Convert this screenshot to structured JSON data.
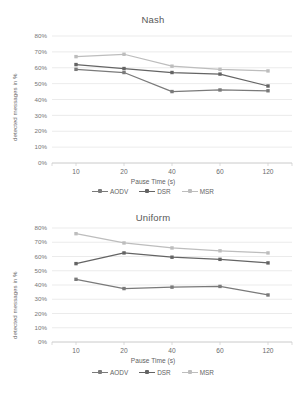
{
  "colors": {
    "aodv": "#7a7a7a",
    "dsr": "#646464",
    "msr": "#bdbdbd",
    "grid": "#e2e2e2",
    "axis": "#cccccc",
    "text": "#5f5f5f",
    "background": "#ffffff"
  },
  "common": {
    "xlabel": "Pause Time (s)",
    "ylabel": "detected messages in %",
    "categories": [
      "10",
      "20",
      "40",
      "60",
      "120"
    ],
    "yticks": [
      "0%",
      "10%",
      "20%",
      "30%",
      "40%",
      "50%",
      "60%",
      "70%",
      "80%"
    ],
    "legend": [
      {
        "label": "AODV",
        "color": "#7a7a7a"
      },
      {
        "label": "DSR",
        "color": "#646464"
      },
      {
        "label": "MSR",
        "color": "#bdbdbd"
      }
    ]
  },
  "chart_data": [
    {
      "type": "line",
      "title": "Nash",
      "xlabel": "Pause Time (s)",
      "ylabel": "detected messages in %",
      "categories": [
        "10",
        "20",
        "40",
        "60",
        "120"
      ],
      "x": [
        10,
        20,
        40,
        60,
        120
      ],
      "ylim": [
        0,
        80
      ],
      "ytick_values": [
        0,
        10,
        20,
        30,
        40,
        50,
        60,
        70,
        80
      ],
      "ytick_labels": [
        "0%",
        "10%",
        "20%",
        "30%",
        "40%",
        "50%",
        "60%",
        "70%",
        "80%"
      ],
      "grid": true,
      "legend_position": "bottom",
      "series": [
        {
          "name": "AODV",
          "color": "#7a7a7a",
          "values": [
            59,
            57,
            45,
            46,
            45.5
          ]
        },
        {
          "name": "DSR",
          "color": "#646464",
          "values": [
            62,
            59.5,
            57,
            56,
            48.5
          ]
        },
        {
          "name": "MSR",
          "color": "#bdbdbd",
          "values": [
            67,
            68.5,
            61,
            59,
            58
          ]
        }
      ]
    },
    {
      "type": "line",
      "title": "Uniform",
      "xlabel": "Pause Time (s)",
      "ylabel": "detected messages in %",
      "categories": [
        "10",
        "20",
        "40",
        "60",
        "120"
      ],
      "x": [
        10,
        20,
        40,
        60,
        120
      ],
      "ylim": [
        0,
        80
      ],
      "ytick_values": [
        0,
        10,
        20,
        30,
        40,
        50,
        60,
        70,
        80
      ],
      "ytick_labels": [
        "0%",
        "10%",
        "20%",
        "30%",
        "40%",
        "50%",
        "60%",
        "70%",
        "80%"
      ],
      "grid": true,
      "legend_position": "bottom",
      "series": [
        {
          "name": "AODV",
          "color": "#7a7a7a",
          "values": [
            44,
            37.5,
            38.5,
            39,
            33
          ]
        },
        {
          "name": "DSR",
          "color": "#646464",
          "values": [
            55,
            62.5,
            59.5,
            58,
            55.5
          ]
        },
        {
          "name": "MSR",
          "color": "#bdbdbd",
          "values": [
            76,
            69.5,
            66,
            64,
            62.5
          ]
        }
      ]
    }
  ]
}
